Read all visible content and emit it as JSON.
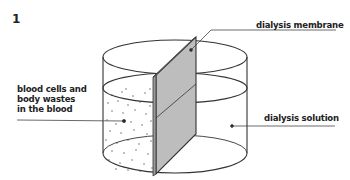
{
  "figure": {
    "number": "1"
  },
  "labels": {
    "membrane": "dialysis membrane",
    "blood_lines": [
      "blood cells and",
      "body wastes",
      "in the blood"
    ],
    "solution": "dialysis solution"
  },
  "colors": {
    "membrane_fill": "#bdbdbd",
    "outline": "#333333",
    "dots": "#555555"
  }
}
